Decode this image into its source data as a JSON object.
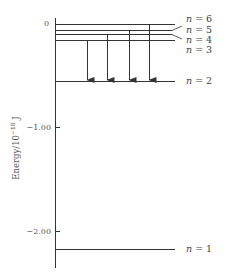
{
  "diagram": {
    "y_axis": {
      "label": "Energy/10",
      "label_exponent": "−18",
      "label_unit": "J",
      "ticks": [
        {
          "value": 0,
          "label": "0"
        },
        {
          "value": -1.0,
          "label": "−1.00"
        },
        {
          "value": -2.0,
          "label": "−2.00"
        }
      ]
    },
    "levels": [
      {
        "n": 6,
        "label": "n = 6",
        "energy": -0.061
      },
      {
        "n": 5,
        "label": "n = 5",
        "energy": -0.087
      },
      {
        "n": 4,
        "label": "n = 4",
        "energy": -0.136
      },
      {
        "n": 3,
        "label": "n = 3",
        "energy": -0.242
      },
      {
        "n": 2,
        "label": "n = 2",
        "energy": -0.545
      },
      {
        "n": 1,
        "label": "n = 1",
        "energy": -2.18
      }
    ],
    "transitions": [
      {
        "from": 3,
        "to": 2
      },
      {
        "from": 4,
        "to": 2
      },
      {
        "from": 5,
        "to": 2
      },
      {
        "from": 6,
        "to": 2
      }
    ],
    "colors": {
      "line": "#333333",
      "text": "#444444"
    }
  }
}
